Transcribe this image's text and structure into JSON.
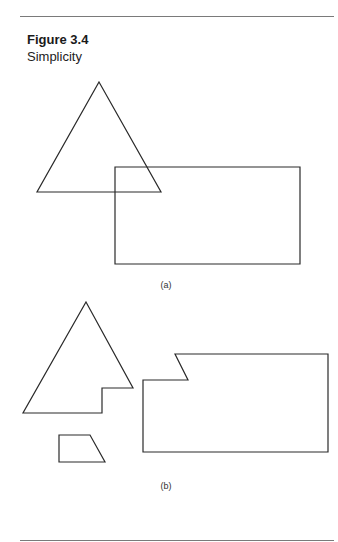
{
  "figure": {
    "number": "Figure 3.4",
    "title": "Simplicity",
    "stroke_color": "#2a2a2a",
    "rule_color": "#7a7a7a",
    "panels": [
      {
        "label": "(a)",
        "description": "Triangle overlapping a rectangle",
        "shapes": [
          {
            "name": "triangle",
            "points": [
              [
                99,
                82
              ],
              [
                161,
                192
              ],
              [
                37,
                192
              ]
            ]
          },
          {
            "name": "rectangle",
            "points": [
              [
                115,
                167
              ],
              [
                300,
                167
              ],
              [
                300,
                264
              ],
              [
                115,
                264
              ]
            ]
          }
        ]
      },
      {
        "label": "(b)",
        "description": "Same figure decomposed into three separate non-overlapping pieces",
        "shapes": [
          {
            "name": "notched-triangle",
            "points": [
              [
                86,
                302
              ],
              [
                133,
                388
              ],
              [
                102,
                388
              ],
              [
                102,
                413
              ],
              [
                23,
                413
              ]
            ]
          },
          {
            "name": "trapezoid",
            "points": [
              [
                59,
                435
              ],
              [
                90,
                435
              ],
              [
                105,
                462
              ],
              [
                59,
                462
              ]
            ]
          },
          {
            "name": "notched-rectangle",
            "points": [
              [
                175,
                354
              ],
              [
                328,
                354
              ],
              [
                328,
                452
              ],
              [
                143,
                452
              ],
              [
                143,
                380
              ],
              [
                188,
                380
              ]
            ]
          }
        ]
      }
    ]
  }
}
